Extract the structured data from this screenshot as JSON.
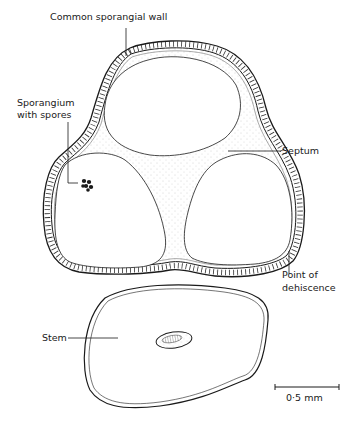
{
  "diagram": {
    "labels": {
      "common_wall": "Common sporangial wall",
      "sporangium_line1": "Sporangium",
      "sporangium_line2": "with spores",
      "septum": "Septum",
      "dehiscence_line1": "Point of",
      "dehiscence_line2": "dehiscence",
      "stem": "Stem"
    },
    "scale_bar": {
      "label": "0·5 mm"
    },
    "colors": {
      "ink": "#1a1a1a",
      "background": "#ffffff",
      "stipple": "#9a9a9a"
    }
  }
}
